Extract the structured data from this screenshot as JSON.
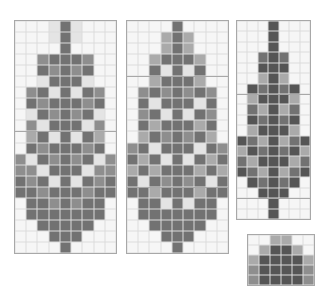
{
  "palette": {
    "0": "#f6f6f6",
    "1": "#e4e4e4",
    "2": "#aaaaaa",
    "3": "#8e8e8e",
    "4": "#727272",
    "5": "#555555",
    "grid_line": "#dcdcdc",
    "border": "#a8a8a8"
  },
  "panels": [
    {
      "name": "chart-panel-1",
      "x": 14,
      "y": 20,
      "w": 101,
      "h": 232,
      "cols": 9,
      "rows": 21,
      "midlines": [
        10
      ],
      "cells": [
        [
          0,
          0,
          0,
          1,
          4,
          1,
          0,
          0,
          0
        ],
        [
          0,
          0,
          0,
          1,
          4,
          1,
          0,
          0,
          0
        ],
        [
          0,
          0,
          0,
          0,
          4,
          0,
          0,
          0,
          0
        ],
        [
          0,
          0,
          3,
          4,
          4,
          4,
          3,
          0,
          0
        ],
        [
          0,
          0,
          4,
          3,
          4,
          3,
          4,
          0,
          0
        ],
        [
          0,
          0,
          1,
          4,
          4,
          4,
          1,
          0,
          0
        ],
        [
          0,
          3,
          4,
          1,
          4,
          1,
          4,
          3,
          0
        ],
        [
          0,
          4,
          3,
          4,
          4,
          4,
          3,
          4,
          0
        ],
        [
          0,
          1,
          4,
          3,
          4,
          3,
          4,
          1,
          0
        ],
        [
          0,
          3,
          1,
          4,
          4,
          4,
          1,
          3,
          0
        ],
        [
          0,
          2,
          4,
          1,
          4,
          1,
          4,
          2,
          0
        ],
        [
          0,
          4,
          3,
          4,
          4,
          4,
          3,
          4,
          0
        ],
        [
          3,
          1,
          4,
          3,
          4,
          3,
          4,
          1,
          3
        ],
        [
          3,
          3,
          1,
          4,
          4,
          4,
          1,
          3,
          3
        ],
        [
          4,
          3,
          4,
          1,
          4,
          1,
          4,
          3,
          4
        ],
        [
          4,
          4,
          3,
          4,
          4,
          4,
          3,
          4,
          4
        ],
        [
          0,
          4,
          4,
          3,
          4,
          3,
          4,
          4,
          0
        ],
        [
          0,
          4,
          4,
          4,
          4,
          4,
          4,
          4,
          0
        ],
        [
          0,
          0,
          4,
          4,
          4,
          4,
          4,
          0,
          0
        ],
        [
          0,
          0,
          0,
          4,
          4,
          4,
          0,
          0,
          0
        ],
        [
          0,
          0,
          0,
          0,
          4,
          0,
          0,
          0,
          0
        ]
      ]
    },
    {
      "name": "chart-panel-2",
      "x": 126,
      "y": 20,
      "w": 101,
      "h": 232,
      "cols": 9,
      "rows": 21,
      "midlines": [
        5,
        15
      ],
      "cells": [
        [
          0,
          0,
          0,
          0,
          4,
          0,
          0,
          0,
          0
        ],
        [
          0,
          0,
          0,
          2,
          4,
          2,
          0,
          0,
          0
        ],
        [
          0,
          0,
          0,
          2,
          4,
          2,
          0,
          0,
          0
        ],
        [
          0,
          0,
          2,
          4,
          4,
          4,
          2,
          0,
          0
        ],
        [
          0,
          0,
          4,
          1,
          4,
          1,
          4,
          0,
          0
        ],
        [
          0,
          0,
          2,
          4,
          4,
          4,
          2,
          0,
          0
        ],
        [
          0,
          3,
          4,
          3,
          4,
          3,
          4,
          3,
          0
        ],
        [
          0,
          4,
          1,
          4,
          4,
          4,
          1,
          4,
          0
        ],
        [
          0,
          3,
          4,
          1,
          4,
          1,
          4,
          3,
          0
        ],
        [
          0,
          4,
          2,
          4,
          4,
          4,
          2,
          4,
          0
        ],
        [
          0,
          2,
          4,
          3,
          4,
          3,
          4,
          2,
          0
        ],
        [
          3,
          4,
          1,
          4,
          4,
          4,
          1,
          4,
          3
        ],
        [
          4,
          2,
          4,
          1,
          4,
          1,
          4,
          2,
          4
        ],
        [
          2,
          4,
          2,
          4,
          4,
          4,
          2,
          4,
          2
        ],
        [
          4,
          1,
          4,
          3,
          4,
          3,
          4,
          1,
          4
        ],
        [
          4,
          4,
          2,
          4,
          4,
          4,
          2,
          4,
          4
        ],
        [
          0,
          4,
          4,
          1,
          4,
          1,
          4,
          4,
          0
        ],
        [
          0,
          4,
          4,
          4,
          4,
          4,
          4,
          4,
          0
        ],
        [
          0,
          0,
          4,
          4,
          4,
          4,
          4,
          0,
          0
        ],
        [
          0,
          0,
          0,
          4,
          4,
          4,
          0,
          0,
          0
        ],
        [
          0,
          0,
          0,
          0,
          4,
          0,
          0,
          0,
          0
        ]
      ]
    },
    {
      "name": "chart-panel-3",
      "x": 236,
      "y": 20,
      "w": 73,
      "h": 198,
      "cols": 7,
      "rows": 19,
      "midlines": [
        7,
        17
      ],
      "cells": [
        [
          0,
          0,
          0,
          5,
          0,
          0,
          0
        ],
        [
          0,
          0,
          0,
          5,
          0,
          0,
          0
        ],
        [
          0,
          0,
          0,
          5,
          0,
          0,
          0
        ],
        [
          0,
          0,
          4,
          5,
          4,
          0,
          0
        ],
        [
          0,
          0,
          5,
          5,
          5,
          0,
          0
        ],
        [
          0,
          0,
          2,
          5,
          2,
          0,
          0
        ],
        [
          0,
          5,
          4,
          5,
          4,
          5,
          0
        ],
        [
          0,
          2,
          5,
          5,
          5,
          2,
          0
        ],
        [
          0,
          4,
          2,
          5,
          2,
          4,
          0
        ],
        [
          0,
          5,
          4,
          5,
          4,
          5,
          0
        ],
        [
          0,
          2,
          5,
          5,
          5,
          2,
          0
        ],
        [
          5,
          4,
          2,
          5,
          2,
          4,
          5
        ],
        [
          2,
          5,
          4,
          5,
          4,
          5,
          2
        ],
        [
          4,
          2,
          5,
          5,
          5,
          2,
          4
        ],
        [
          5,
          4,
          2,
          5,
          2,
          4,
          5
        ],
        [
          0,
          5,
          4,
          5,
          4,
          5,
          0
        ],
        [
          0,
          0,
          5,
          5,
          5,
          0,
          0
        ],
        [
          0,
          0,
          0,
          5,
          0,
          0,
          0
        ],
        [
          0,
          0,
          0,
          5,
          0,
          0,
          0
        ]
      ]
    },
    {
      "name": "chart-panel-4",
      "x": 247,
      "y": 234,
      "w": 66,
      "h": 50,
      "cols": 6,
      "rows": 5,
      "midlines": [],
      "cells": [
        [
          0,
          0,
          2,
          2,
          0,
          0
        ],
        [
          0,
          2,
          5,
          5,
          2,
          0
        ],
        [
          2,
          5,
          5,
          5,
          5,
          2
        ],
        [
          3,
          5,
          5,
          5,
          5,
          3
        ],
        [
          3,
          5,
          5,
          5,
          5,
          3
        ]
      ]
    }
  ]
}
